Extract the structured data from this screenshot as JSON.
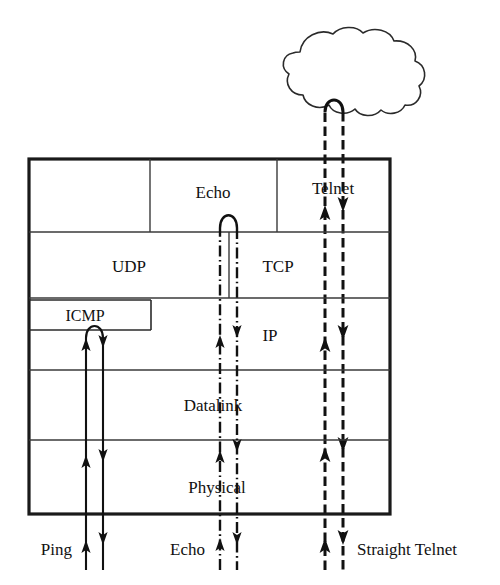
{
  "diagram": {
    "type": "protocol-stack-diagram",
    "stroke_color": "#111111",
    "background_color": "#ffffff"
  },
  "cloud": {
    "label": "network-cloud",
    "description": "network cloud"
  },
  "layers": [
    {
      "id": "application",
      "label": ""
    },
    {
      "id": "transport",
      "label": ""
    },
    {
      "id": "network",
      "label": ""
    },
    {
      "id": "datalink",
      "label": "Datalink"
    },
    {
      "id": "physical",
      "label": "Physical"
    }
  ],
  "blocks": {
    "echo": "Echo",
    "telnet": "Telnet",
    "udp": "UDP",
    "tcp": "TCP",
    "icmp": "ICMP",
    "ip": "IP",
    "datalink": "Datalink",
    "physical": "Physical"
  },
  "flows": [
    {
      "id": "ping",
      "label": "Ping",
      "style": "solid",
      "turnaround": "icmp",
      "description": "Ping loops back at the ICMP layer"
    },
    {
      "id": "echo",
      "label": "Echo",
      "style": "dash-dot",
      "turnaround": "echo",
      "description": "Echo loops back at the Echo application above UDP"
    },
    {
      "id": "straight-telnet",
      "label": "Straight Telnet",
      "style": "dashed",
      "turnaround": "cloud",
      "description": "Telnet travels up through the stack and out into the network cloud"
    }
  ],
  "bottom_labels": {
    "left": "Ping",
    "middle": "Echo",
    "right": "Straight Telnet"
  }
}
